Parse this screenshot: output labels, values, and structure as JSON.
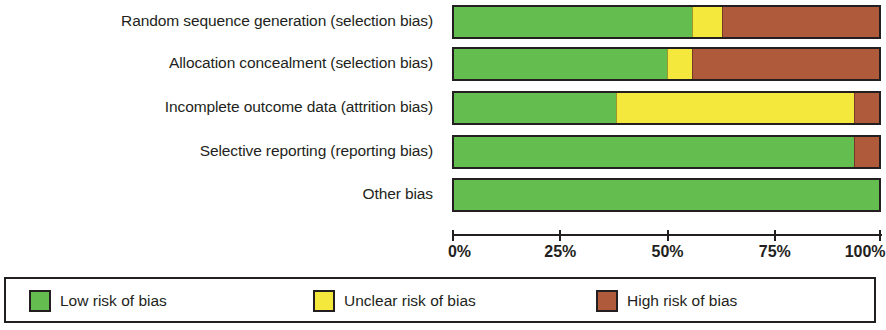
{
  "chart_data": {
    "type": "bar",
    "orientation": "horizontal",
    "stacked": true,
    "normalized_percent": true,
    "title": "",
    "xlabel": "",
    "ylabel": "",
    "xlim": [
      0,
      100
    ],
    "grid": false,
    "legend_position": "bottom",
    "categories": [
      "Random sequence generation (selection bias)",
      "Allocation concealment (selection bias)",
      "Incomplete outcome data (attrition bias)",
      "Selective reporting (reporting bias)",
      "Other bias"
    ],
    "series": [
      {
        "name": "Low risk of bias",
        "color": "#63bd4f",
        "values": [
          56,
          50,
          38,
          94,
          100
        ]
      },
      {
        "name": "Unclear risk of bias",
        "color": "#f5e83c",
        "values": [
          7,
          6,
          56,
          0,
          0
        ]
      },
      {
        "name": "High risk of bias",
        "color": "#b05a3c",
        "values": [
          37,
          44,
          6,
          6,
          0
        ]
      }
    ],
    "tick_values": [
      0,
      25,
      50,
      75,
      100
    ],
    "tick_labels": [
      "0%",
      "25%",
      "50%",
      "75%",
      "100%"
    ]
  },
  "legend": {
    "items": [
      {
        "label": "Low risk of bias",
        "swatch_class": "sw-low",
        "color": "#63bd4f",
        "left": 23
      },
      {
        "label": "Unclear risk of bias",
        "swatch_class": "sw-unclear",
        "color": "#f5e83c",
        "left": 307
      },
      {
        "label": "High risk of bias",
        "swatch_class": "sw-high",
        "color": "#b05a3c",
        "left": 590
      }
    ]
  },
  "colors": {
    "low_risk": "#63bd4f",
    "unclear_risk": "#f5e83c",
    "high_risk": "#b05a3c",
    "outline": "#231f20",
    "background": "#ffffff"
  }
}
